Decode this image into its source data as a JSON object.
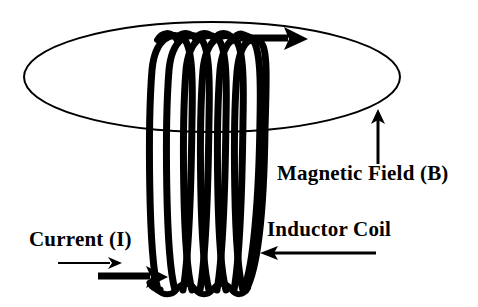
{
  "figure": {
    "background_color": "#ffffff",
    "ink_color": "#000000",
    "width": 478,
    "height": 307
  },
  "labels": {
    "magnetic_field": "Magnetic Field (B)",
    "inductor_coil": "Inductor Coil",
    "current": "Current (I)"
  },
  "icons": {
    "coil": "solenoid-coil-icon",
    "field_loop": "magnetic-field-ellipse-icon",
    "current_arrow_thin": "arrow-right-thin-icon",
    "current_arrow_thick": "arrow-right-thick-icon",
    "coil_top_arrow": "arrow-right-thick-icon",
    "field_arrow": "arrow-up-icon",
    "coil_pointer_arrow": "arrow-left-icon"
  },
  "geometry": {
    "field_ellipse": {
      "center_x": 212,
      "center_y": 77,
      "radius_x": 188,
      "radius_y": 55,
      "stroke_width": 2
    },
    "coil": {
      "turns": 6,
      "left_x": 152,
      "right_x": 252,
      "top_y": 33,
      "bottom_y": 290,
      "stroke_width": 7
    },
    "arrows": [
      {
        "name": "current-arrow-thin",
        "x1": 58,
        "y1": 263,
        "x2": 118,
        "y2": 263,
        "stroke_width": 2.2,
        "head": "right"
      },
      {
        "name": "current-arrow-thick",
        "x1": 98,
        "y1": 276,
        "x2": 165,
        "y2": 276,
        "stroke_width": 7,
        "head": "right"
      },
      {
        "name": "coil-top-arrow",
        "x1": 235,
        "y1": 38,
        "x2": 306,
        "y2": 38,
        "stroke_width": 7,
        "head": "right"
      },
      {
        "name": "field-direction-arrow",
        "x1": 378,
        "y1": 164,
        "x2": 378,
        "y2": 110,
        "stroke_width": 3,
        "head": "up"
      },
      {
        "name": "inductor-coil-pointer",
        "x1": 376,
        "y1": 253,
        "x2": 260,
        "y2": 253,
        "stroke_width": 3,
        "head": "left"
      }
    ]
  }
}
